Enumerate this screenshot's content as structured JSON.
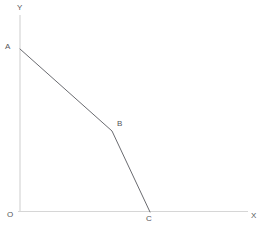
{
  "figure": {
    "background_color": "#ffffff",
    "width": 269,
    "height": 228,
    "axis_color": "#d6d6d6",
    "curve_color": "#6a6b70",
    "label_color": "#55565a"
  },
  "axes": {
    "y_axis": {
      "label": "Y",
      "x": 20,
      "y_top": 15,
      "y_bottom": 212
    },
    "x_axis": {
      "label": "X",
      "y": 211,
      "x_left": 18,
      "x_right": 248
    },
    "origin": {
      "label": "O",
      "x": 20,
      "y": 211
    }
  },
  "chart_data": {
    "type": "line",
    "title": "",
    "xlabel": "X",
    "ylabel": "Y",
    "grid": false,
    "legend": null,
    "annotations": [
      "A",
      "B",
      "C",
      "O"
    ],
    "series": [
      {
        "name": "ABC",
        "points": [
          {
            "label": "A",
            "x": 0,
            "y": 163
          },
          {
            "label": "B",
            "x": 92,
            "y": 81
          },
          {
            "label": "C",
            "x": 130,
            "y": 0
          }
        ]
      }
    ],
    "pixel_points": [
      {
        "label": "A",
        "px": 20,
        "py": 49
      },
      {
        "label": "B",
        "px": 112,
        "py": 131
      },
      {
        "label": "C",
        "px": 150,
        "py": 212
      }
    ],
    "xlim": [
      0,
      228
    ],
    "ylim": [
      0,
      197
    ]
  },
  "labels": {
    "y_axis": "Y",
    "x_axis": "X",
    "origin": "O",
    "point_a": "A",
    "point_b": "B",
    "point_c": "C"
  }
}
